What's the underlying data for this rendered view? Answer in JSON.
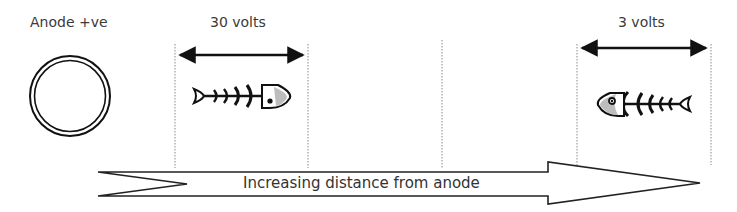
{
  "labels": {
    "anode": "Anode +ve",
    "left_voltage": "30 volts",
    "right_voltage": "3 volts",
    "arrow_caption": "Increasing distance from anode"
  },
  "icons": {
    "anode": "double-circle",
    "fish_left": "fish-skeleton-facing-right",
    "fish_right": "fish-skeleton-facing-left",
    "span_arrow": "double-headed-arrow",
    "direction_arrow": "block-arrow-right"
  },
  "colors": {
    "stroke": "#111111",
    "text": "#3a3a3a",
    "dotted_line": "#888888",
    "fish_head_fill": "#bdbdbd"
  }
}
